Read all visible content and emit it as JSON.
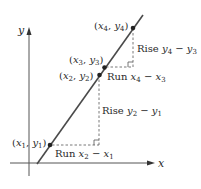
{
  "figure": {
    "axes": {
      "x_label": "x",
      "y_label": "y"
    },
    "points": [
      {
        "id": "p1",
        "label_x": "x",
        "sub_x": "1",
        "label_y": "y",
        "sub_y": "1"
      },
      {
        "id": "p2",
        "label_x": "x",
        "sub_x": "2",
        "label_y": "y",
        "sub_y": "2"
      },
      {
        "id": "p3",
        "label_x": "x",
        "sub_x": "3",
        "label_y": "y",
        "sub_y": "3"
      },
      {
        "id": "p4",
        "label_x": "x",
        "sub_x": "4",
        "label_y": "y",
        "sub_y": "4"
      }
    ],
    "annotations": {
      "run1": {
        "word": "Run",
        "a": "x",
        "a_sub": "2",
        "op": "−",
        "b": "x",
        "b_sub": "1"
      },
      "rise1": {
        "word": "Rise",
        "a": "y",
        "a_sub": "2",
        "op": "−",
        "b": "y",
        "b_sub": "1"
      },
      "run2": {
        "word": "Run",
        "a": "x",
        "a_sub": "4",
        "op": "−",
        "b": "x",
        "b_sub": "3"
      },
      "rise2": {
        "word": "Rise",
        "a": "y",
        "a_sub": "4",
        "op": "−",
        "b": "y",
        "b_sub": "3"
      }
    },
    "colors": {
      "line": "#4a4a4a",
      "dashed": "#555555",
      "text": "#2a2a2a",
      "point": "#222222"
    }
  }
}
